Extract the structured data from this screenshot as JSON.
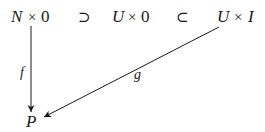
{
  "diagram": {
    "type": "commutative-diagram",
    "top_row": {
      "node1": {
        "var": "N",
        "times": "×",
        "factor": "0"
      },
      "rel1": "⊃",
      "node2": {
        "var": "U",
        "times": "×",
        "factor": "0"
      },
      "rel2": "⊂",
      "node3": {
        "var": "U",
        "times": "×",
        "factor": "I"
      }
    },
    "bottom": {
      "node": "P"
    },
    "arrows": [
      {
        "from": "N × 0",
        "to": "P",
        "label": "f",
        "direction": "down"
      },
      {
        "from": "U × I",
        "to": "P",
        "label": "g",
        "direction": "diagonal-down-left"
      }
    ],
    "colors": {
      "ink": "#1a1a1a",
      "background": "#ffffff"
    }
  }
}
